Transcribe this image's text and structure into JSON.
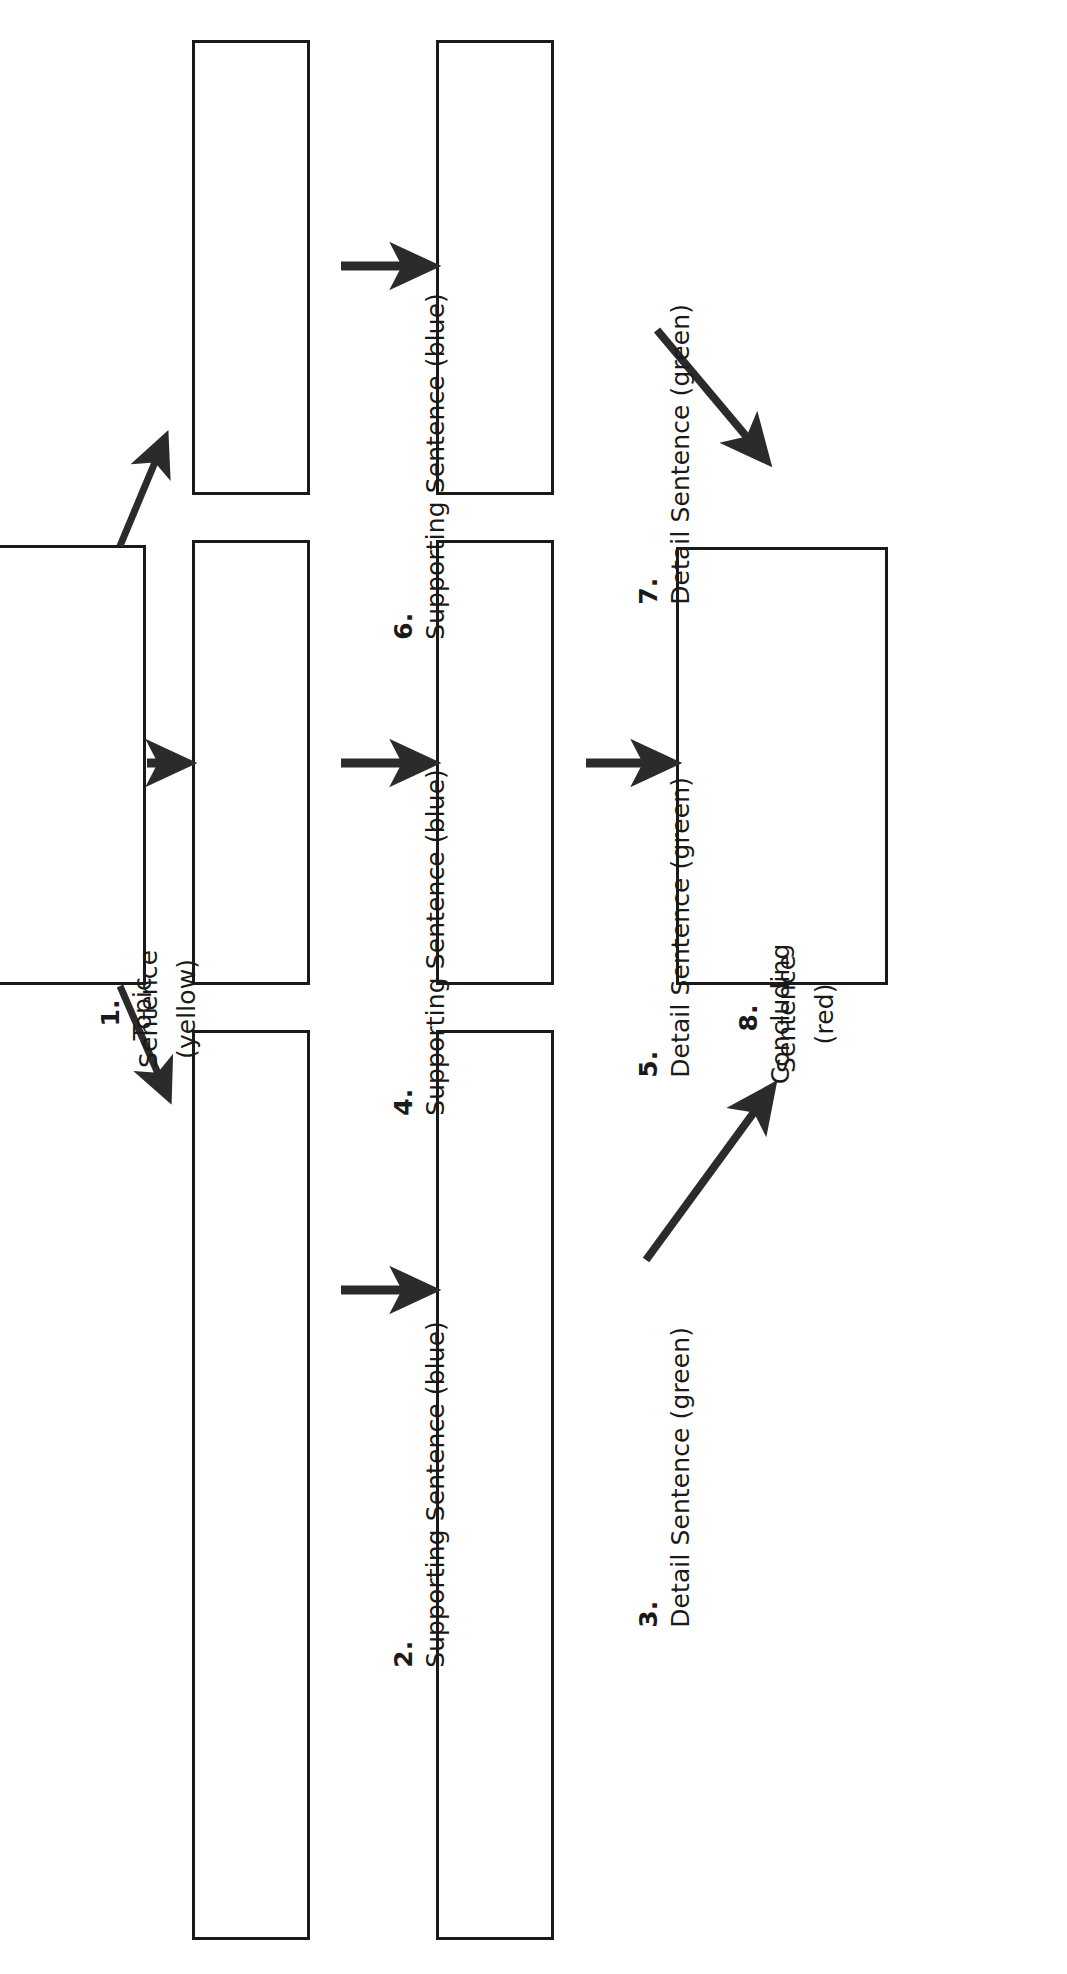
{
  "diagram": {
    "orientation": "rotated-90-ccw",
    "colors": {
      "outline": "#1a1a1a",
      "arrow": "#2b2b2b",
      "background": "#ffffff",
      "topic_color_word": "yellow",
      "supporting_color_word": "blue",
      "detail_color_word": "green",
      "concluding_color_word": "red"
    },
    "nodes": [
      {
        "id": "n1",
        "number": "1.",
        "label": "Topic Sentence (yellow)",
        "lines": [
          "Topic",
          "Sentence",
          "(yellow)"
        ],
        "role": "topic"
      },
      {
        "id": "n2",
        "number": "2.",
        "label": "Supporting Sentence (blue)",
        "lines": [
          "Supporting Sentence (blue)"
        ],
        "role": "supporting"
      },
      {
        "id": "n3",
        "number": "3.",
        "label": "Detail Sentence (green)",
        "lines": [
          "Detail Sentence (green)"
        ],
        "role": "detail"
      },
      {
        "id": "n4",
        "number": "4.",
        "label": "Supporting Sentence (blue)",
        "lines": [
          "Supporting Sentence (blue)"
        ],
        "role": "supporting"
      },
      {
        "id": "n5",
        "number": "5.",
        "label": "Detail Sentence (green)",
        "lines": [
          "Detail Sentence (green)"
        ],
        "role": "detail"
      },
      {
        "id": "n6",
        "number": "6.",
        "label": "Supporting Sentence (blue)",
        "lines": [
          "Supporting Sentence (blue)"
        ],
        "role": "supporting"
      },
      {
        "id": "n7",
        "number": "7.",
        "label": "Detail Sentence (green)",
        "lines": [
          "Detail Sentence (green)"
        ],
        "role": "detail"
      },
      {
        "id": "n8",
        "number": "8.",
        "label": "Concluding Sentence (red)",
        "lines": [
          "Concluding",
          "Sentence",
          "(red)"
        ],
        "role": "concluding"
      }
    ],
    "connections": [
      {
        "from": "n1",
        "to": "n6",
        "style": "diagonal"
      },
      {
        "from": "n1",
        "to": "n4",
        "style": "straight"
      },
      {
        "from": "n1",
        "to": "n2",
        "style": "diagonal"
      },
      {
        "from": "n6",
        "to": "n7",
        "style": "straight"
      },
      {
        "from": "n4",
        "to": "n5",
        "style": "straight"
      },
      {
        "from": "n2",
        "to": "n3",
        "style": "straight"
      },
      {
        "from": "n7",
        "to": "n8",
        "style": "diagonal"
      },
      {
        "from": "n5",
        "to": "n8",
        "style": "straight"
      },
      {
        "from": "n3",
        "to": "n8",
        "style": "diagonal"
      }
    ]
  }
}
